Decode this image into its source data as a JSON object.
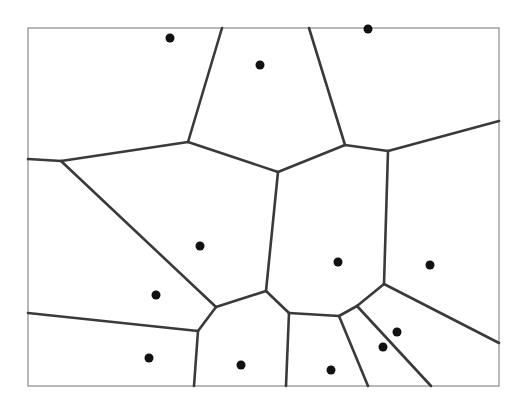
{
  "diagram": {
    "type": "voronoi",
    "colors": {
      "background": "#ffffff",
      "frame": "#8a8a8a",
      "edge": "#3a3a3a",
      "site": "#111111"
    },
    "frame": {
      "x": 28,
      "y": 28,
      "width": 471,
      "height": 358
    },
    "sites": [
      {
        "x": 170,
        "y": 38
      },
      {
        "x": 260,
        "y": 65
      },
      {
        "x": 368,
        "y": 29
      },
      {
        "x": 200,
        "y": 246
      },
      {
        "x": 338,
        "y": 262
      },
      {
        "x": 430,
        "y": 265
      },
      {
        "x": 156,
        "y": 295
      },
      {
        "x": 149,
        "y": 358
      },
      {
        "x": 241,
        "y": 365
      },
      {
        "x": 397,
        "y": 332
      },
      {
        "x": 383,
        "y": 347
      },
      {
        "x": 331,
        "y": 370
      }
    ],
    "edges": [
      {
        "x1": 222,
        "y1": 28,
        "x2": 188,
        "y2": 142
      },
      {
        "x1": 28,
        "y1": 159,
        "x2": 61,
        "y2": 161
      },
      {
        "x1": 61,
        "y1": 161,
        "x2": 188,
        "y2": 142
      },
      {
        "x1": 188,
        "y1": 142,
        "x2": 278,
        "y2": 172
      },
      {
        "x1": 309,
        "y1": 28,
        "x2": 345,
        "y2": 145
      },
      {
        "x1": 278,
        "y1": 172,
        "x2": 345,
        "y2": 145
      },
      {
        "x1": 345,
        "y1": 145,
        "x2": 388,
        "y2": 151
      },
      {
        "x1": 388,
        "y1": 151,
        "x2": 499,
        "y2": 121
      },
      {
        "x1": 61,
        "y1": 161,
        "x2": 216,
        "y2": 307
      },
      {
        "x1": 216,
        "y1": 307,
        "x2": 266,
        "y2": 291
      },
      {
        "x1": 216,
        "y1": 307,
        "x2": 198,
        "y2": 331
      },
      {
        "x1": 28,
        "y1": 313,
        "x2": 198,
        "y2": 331
      },
      {
        "x1": 198,
        "y1": 331,
        "x2": 194,
        "y2": 386
      },
      {
        "x1": 278,
        "y1": 172,
        "x2": 266,
        "y2": 291
      },
      {
        "x1": 266,
        "y1": 291,
        "x2": 289,
        "y2": 313
      },
      {
        "x1": 289,
        "y1": 313,
        "x2": 286,
        "y2": 386
      },
      {
        "x1": 289,
        "y1": 313,
        "x2": 339,
        "y2": 316
      },
      {
        "x1": 339,
        "y1": 316,
        "x2": 368,
        "y2": 386
      },
      {
        "x1": 339,
        "y1": 316,
        "x2": 357,
        "y2": 306
      },
      {
        "x1": 357,
        "y1": 306,
        "x2": 431,
        "y2": 386
      },
      {
        "x1": 357,
        "y1": 306,
        "x2": 384,
        "y2": 284
      },
      {
        "x1": 384,
        "y1": 284,
        "x2": 388,
        "y2": 151
      },
      {
        "x1": 384,
        "y1": 284,
        "x2": 499,
        "y2": 343
      }
    ]
  }
}
